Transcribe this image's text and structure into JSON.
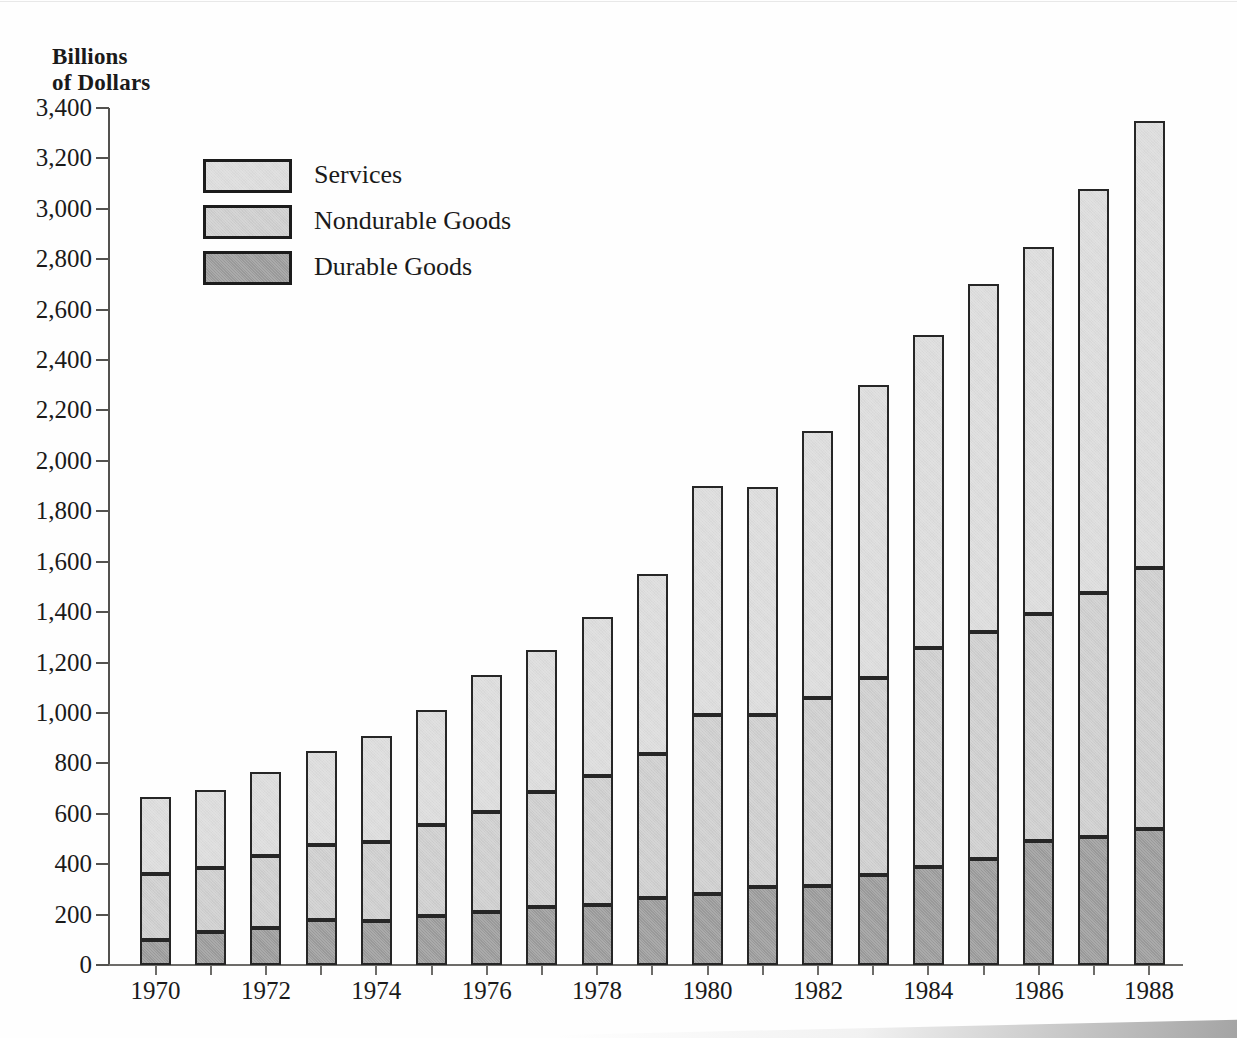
{
  "chart_data": {
    "type": "bar",
    "subtype": "stacked-column",
    "title": "",
    "ylabel": "Billions\nof Dollars",
    "xlabel": "",
    "ylim": [
      0,
      3400
    ],
    "ytick_step": 200,
    "grid": false,
    "legend_position": "upper-left-inside",
    "ytick_labels": [
      "3,400",
      "3,200",
      "3,000",
      "2,800",
      "2,600",
      "2,400",
      "2,200",
      "2,000",
      "1,800",
      "1,600",
      "1,400",
      "1,200",
      "1,000",
      "800",
      "600",
      "400",
      "200",
      "0"
    ],
    "ytick_values": [
      3400,
      3200,
      3000,
      2800,
      2600,
      2400,
      2200,
      2000,
      1800,
      1600,
      1400,
      1200,
      1000,
      800,
      600,
      400,
      200,
      0
    ],
    "categories": [
      "1970",
      "1971",
      "1972",
      "1973",
      "1974",
      "1975",
      "1976",
      "1977",
      "1978",
      "1979",
      "1980",
      "1981",
      "1982",
      "1983",
      "1984",
      "1985",
      "1986",
      "1987",
      "1988"
    ],
    "xtick_labels_shown": [
      "1970",
      "1972",
      "1974",
      "1976",
      "1978",
      "1980",
      "1982",
      "1984",
      "1986",
      "1988"
    ],
    "series": [
      {
        "name": "Durable Goods",
        "color": "#9b9b9b",
        "values": [
          100,
          130,
          148,
          177,
          173,
          195,
          210,
          230,
          240,
          267,
          281,
          311,
          315,
          357,
          388,
          422,
          492,
          508,
          540
        ]
      },
      {
        "name": "Nondurable Goods",
        "color": "#cecece",
        "values": [
          260,
          253,
          283,
          298,
          315,
          360,
          396,
          458,
          511,
          571,
          712,
          681,
          746,
          781,
          868,
          901,
          900,
          968,
          1035
        ]
      },
      {
        "name": "Services",
        "color": "#dcdcdc",
        "values": [
          305,
          312,
          336,
          375,
          422,
          455,
          544,
          562,
          629,
          712,
          907,
          903,
          1057,
          1162,
          1244,
          1377,
          1458,
          1604,
          1775
        ]
      }
    ],
    "totals": [
      665,
      695,
      767,
      850,
      910,
      1010,
      1150,
      1250,
      1380,
      1550,
      1900,
      1895,
      2118,
      2300,
      2500,
      2700,
      2850,
      3080,
      3350
    ],
    "stack_boundaries_durable_top": [
      100,
      130,
      148,
      177,
      173,
      195,
      210,
      230,
      240,
      267,
      281,
      311,
      315,
      357,
      388,
      422,
      492,
      508,
      540
    ],
    "stack_boundaries_nondurable_top": [
      360,
      383,
      431,
      475,
      488,
      555,
      606,
      688,
      751,
      838,
      993,
      992,
      1061,
      1138,
      1256,
      1323,
      1392,
      1476,
      1575
    ]
  },
  "legend": {
    "items": [
      {
        "label": "Services",
        "key": "services"
      },
      {
        "label": "Nondurable Goods",
        "key": "nondurable"
      },
      {
        "label": "Durable Goods",
        "key": "durable"
      }
    ]
  }
}
